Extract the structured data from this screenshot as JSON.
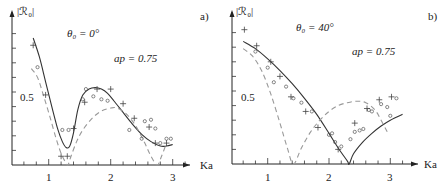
{
  "chart_data": [
    {
      "panel": "a)",
      "type": "line",
      "annotations": {
        "angle": "θ₀ = 0°",
        "param": "ap = 0.75"
      },
      "ylabel": "|ℛ₀|",
      "xlabel": "Ka",
      "xticks": [
        1,
        2,
        3
      ],
      "yticks_labeled": [
        0.5
      ],
      "xlim": [
        0.4,
        3.25
      ],
      "ylim": [
        0,
        0.95
      ],
      "grid": false,
      "series": [
        {
          "name": "theory (solid)",
          "style": "solid",
          "x": [
            0.75,
            0.85,
            0.95,
            1.05,
            1.15,
            1.22,
            1.28,
            1.34,
            1.4,
            1.47,
            1.55,
            1.65,
            1.75,
            1.85,
            1.95,
            2.05,
            2.2,
            2.35,
            2.5,
            2.65,
            2.8,
            2.9,
            3.0
          ],
          "y": [
            0.87,
            0.74,
            0.57,
            0.4,
            0.24,
            0.16,
            0.12,
            0.13,
            0.22,
            0.38,
            0.48,
            0.52,
            0.53,
            0.52,
            0.49,
            0.44,
            0.36,
            0.28,
            0.21,
            0.16,
            0.13,
            0.13,
            0.14
          ]
        },
        {
          "name": "approximation (dashed)",
          "style": "dashed",
          "x": [
            0.72,
            0.82,
            0.92,
            1.02,
            1.12,
            1.2,
            1.27,
            1.31,
            1.36,
            1.45,
            1.55,
            1.7,
            1.85,
            2.0,
            2.1,
            2.25,
            2.4,
            2.55,
            2.65,
            2.75,
            2.82,
            2.9
          ],
          "y": [
            0.66,
            0.6,
            0.47,
            0.33,
            0.18,
            0.08,
            0.02,
            0.0,
            0.06,
            0.16,
            0.24,
            0.32,
            0.37,
            0.39,
            0.39,
            0.35,
            0.27,
            0.15,
            0.06,
            0.0,
            0.06,
            0.15
          ]
        }
      ],
      "markers": {
        "circles": [
          [
            0.82,
            0.67
          ],
          [
            1.22,
            0.24
          ],
          [
            1.32,
            0.24
          ],
          [
            1.55,
            0.45
          ],
          [
            1.6,
            0.52
          ],
          [
            1.72,
            0.47
          ],
          [
            1.85,
            0.45
          ],
          [
            1.95,
            0.44
          ],
          [
            2.3,
            0.24
          ],
          [
            2.5,
            0.18
          ],
          [
            2.55,
            0.3
          ],
          [
            2.65,
            0.31
          ],
          [
            2.72,
            0.25
          ],
          [
            2.8,
            0.15
          ],
          [
            2.9,
            0.18
          ],
          [
            2.97,
            0.18
          ]
        ],
        "plus": [
          [
            0.75,
            0.82
          ],
          [
            0.95,
            0.48
          ],
          [
            1.2,
            0.06
          ],
          [
            1.3,
            0.06
          ],
          [
            1.4,
            0.25
          ],
          [
            1.58,
            0.43
          ],
          [
            1.78,
            0.52
          ],
          [
            2.0,
            0.52
          ],
          [
            2.2,
            0.42
          ],
          [
            2.38,
            0.32
          ],
          [
            2.62,
            0.26
          ],
          [
            2.72,
            0.15
          ],
          [
            2.9,
            0.15
          ]
        ]
      }
    },
    {
      "panel": "b)",
      "type": "line",
      "annotations": {
        "angle": "θ₀ = 40°",
        "param": "ap = 0.75"
      },
      "ylabel": "|ℛ₀|",
      "xlabel": "Ka",
      "xticks": [
        1,
        2,
        3
      ],
      "yticks_labeled": [
        0.5
      ],
      "xlim": [
        0.4,
        3.35
      ],
      "ylim": [
        0,
        0.95
      ],
      "grid": false,
      "series": [
        {
          "name": "theory (solid)",
          "style": "solid",
          "x": [
            0.6,
            0.8,
            1.0,
            1.2,
            1.4,
            1.6,
            1.8,
            2.0,
            2.15,
            2.3,
            2.33,
            2.4,
            2.55,
            2.7,
            2.85,
            3.0,
            3.2
          ],
          "y": [
            0.84,
            0.79,
            0.72,
            0.64,
            0.55,
            0.45,
            0.34,
            0.21,
            0.11,
            0.02,
            0.0,
            0.07,
            0.15,
            0.21,
            0.26,
            0.3,
            0.34
          ]
        },
        {
          "name": "approximation (dashed)",
          "style": "dashed",
          "x": [
            0.6,
            0.75,
            0.9,
            1.05,
            1.2,
            1.32,
            1.42,
            1.55,
            1.7,
            1.85,
            2.0,
            2.15,
            2.3,
            2.45,
            2.6,
            2.75,
            2.85,
            2.95
          ],
          "y": [
            0.79,
            0.74,
            0.64,
            0.48,
            0.28,
            0.11,
            0.0,
            0.11,
            0.22,
            0.3,
            0.36,
            0.4,
            0.42,
            0.43,
            0.42,
            0.37,
            0.3,
            0.22
          ]
        }
      ],
      "markers": {
        "circles": [
          [
            0.8,
            0.77
          ],
          [
            1.0,
            0.66
          ],
          [
            1.1,
            0.56
          ],
          [
            1.3,
            0.53
          ],
          [
            1.42,
            0.45
          ],
          [
            1.55,
            0.42
          ],
          [
            1.72,
            0.36
          ],
          [
            2.0,
            0.2
          ],
          [
            2.05,
            0.21
          ],
          [
            2.1,
            0.15
          ],
          [
            2.2,
            0.12
          ],
          [
            2.35,
            0.17
          ],
          [
            2.42,
            0.22
          ],
          [
            2.5,
            0.23
          ],
          [
            2.56,
            0.24
          ],
          [
            2.65,
            0.37
          ],
          [
            2.7,
            0.36
          ],
          [
            2.85,
            0.41
          ],
          [
            2.95,
            0.39
          ],
          [
            3.0,
            0.33
          ],
          [
            3.1,
            0.45
          ]
        ],
        "plus": [
          [
            0.62,
            0.92
          ],
          [
            0.82,
            0.81
          ],
          [
            1.05,
            0.7
          ],
          [
            1.2,
            0.6
          ],
          [
            1.38,
            0.46
          ],
          [
            1.62,
            0.36
          ],
          [
            1.82,
            0.25
          ],
          [
            2.15,
            0.1
          ],
          [
            2.42,
            0.28
          ],
          [
            2.62,
            0.38
          ],
          [
            2.82,
            0.44
          ],
          [
            3.02,
            0.46
          ]
        ]
      }
    }
  ],
  "panels": [
    {
      "label": "a)",
      "angle": "θ₀ = 0°",
      "param": "ap = 0.75",
      "ylabel": "|ℛ₀|",
      "xlabel": "Ka",
      "ytick": "0.5",
      "xticks": [
        "1",
        "2",
        "3"
      ]
    },
    {
      "label": "b)",
      "angle": "θ₀ = 40°",
      "param": "ap = 0.75",
      "ylabel": "|ℛ₀|",
      "xlabel": "Ka",
      "ytick": "0.5",
      "xticks": [
        "1",
        "2",
        "3"
      ]
    }
  ],
  "colors": {
    "solid": "#333333",
    "dashed": "#999999",
    "axis": "#222222"
  }
}
